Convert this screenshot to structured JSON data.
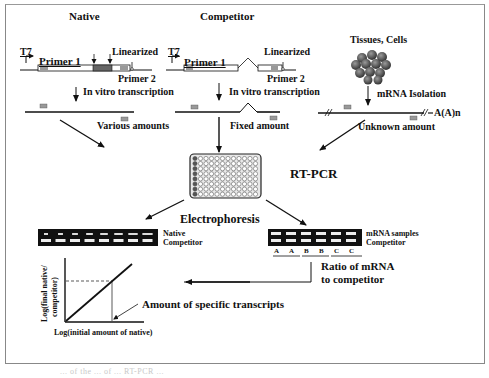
{
  "diagram": {
    "columns": {
      "native": {
        "heading": "Native",
        "promoter": "T7",
        "primer1": "Primer 1",
        "primer2": "Primer 2",
        "linearized": "Linearized",
        "step": "In vitro transcription",
        "amount": "Various amounts"
      },
      "competitor": {
        "heading": "Competitor",
        "promoter": "T7",
        "primer1": "Primer 1",
        "primer2": "Primer 2",
        "linearized": "Linearized",
        "step": "In vitro transcription",
        "amount": "Fixed amount"
      },
      "sample": {
        "heading": "Tissues, Cells",
        "step": "mRNA Isolation",
        "polyA": "A(A)n",
        "amount": "Unknown amount"
      }
    },
    "center": {
      "rtpcr": "RT-PCR",
      "electrophoresis": "Electrophoresis"
    },
    "gel_left": {
      "band_top": "Native",
      "band_bottom": "Competitor",
      "lanes": 8
    },
    "gel_right": {
      "band_top": "mRNA samples",
      "band_bottom": "Competitor",
      "lane_labels": [
        "A",
        "A",
        "B",
        "B",
        "C",
        "C"
      ],
      "note_line1": "Ratio of mRNA",
      "note_line2": "to competitor"
    },
    "plot": {
      "ylabel_line1": "Log(final native/",
      "ylabel_line2": "competitor)",
      "xlabel": "Log(initial amount of native)",
      "annotation": "Amount of specific transcripts"
    },
    "caption": "... of the ... of ... RT-PCR ..."
  }
}
